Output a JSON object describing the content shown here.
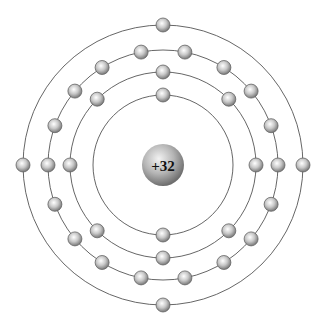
{
  "diagram": {
    "type": "bohr-atom-model",
    "center": [
      163,
      165
    ],
    "nucleus": {
      "label": "+32",
      "radius": 21,
      "colors": {
        "highlight": "#f2f2f2",
        "mid": "#b5b5b5",
        "edge": "#6e6e6e"
      }
    },
    "electron": {
      "radius": 7,
      "colors": {
        "highlight": "#ffffff",
        "mid": "#c8c8c8",
        "edge": "#707070",
        "stroke": "#666666"
      }
    },
    "shell_color": "#555555",
    "shells": [
      {
        "index": 1,
        "radius": 70,
        "electron_count": 2,
        "electrons_deg": [
          90,
          270
        ]
      },
      {
        "index": 2,
        "radius": 93,
        "electron_count": 8,
        "electrons_deg": [
          0,
          45,
          90,
          135,
          180,
          225,
          270,
          315
        ]
      },
      {
        "index": 3,
        "radius": 115,
        "electron_count": 18,
        "electrons_deg": [
          0,
          20,
          40,
          58,
          79,
          101,
          122,
          140,
          160,
          180,
          200,
          220,
          238,
          259,
          281,
          302,
          320,
          340
        ]
      },
      {
        "index": 4,
        "radius": 140,
        "electron_count": 4,
        "electrons_deg": [
          0,
          90,
          180,
          270
        ]
      }
    ]
  }
}
